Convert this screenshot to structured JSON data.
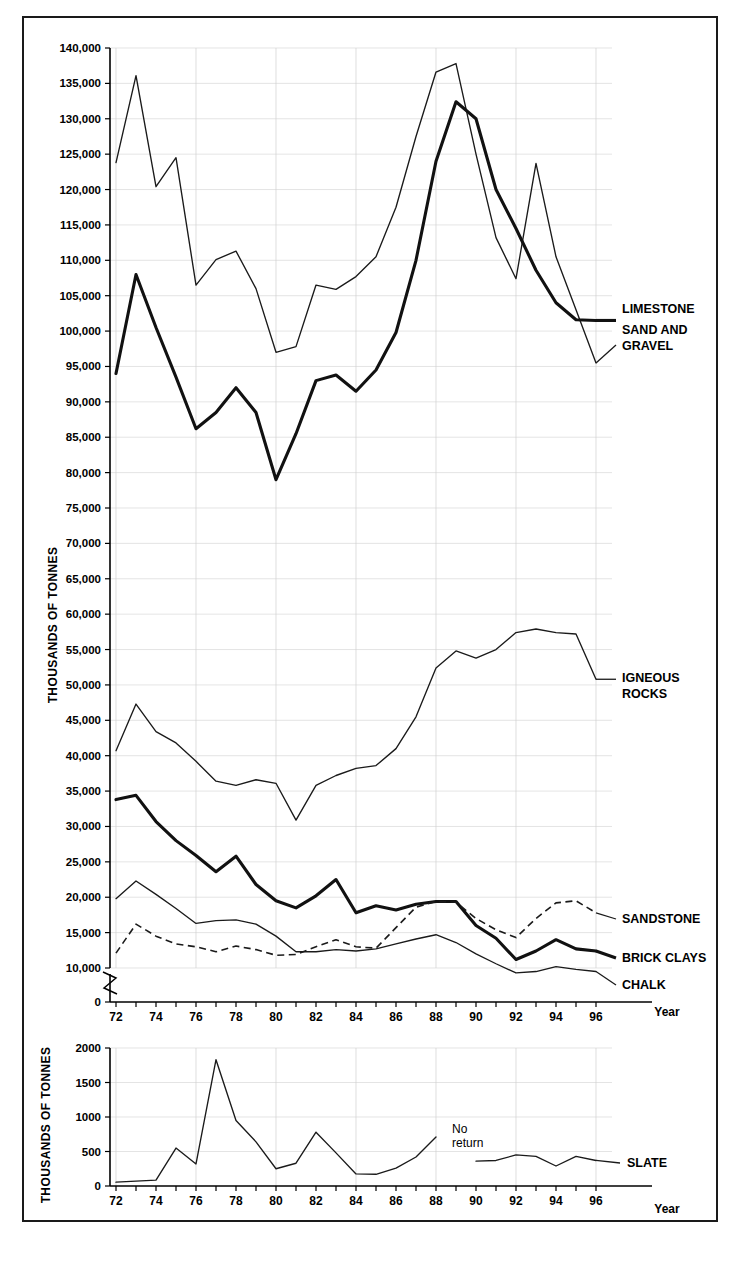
{
  "figure": {
    "frame_border_color": "#1a1a1a",
    "background": "#ffffff"
  },
  "upper_panel": {
    "ylabel": "THOUSANDS OF TONNES",
    "xlabel": "Year",
    "axis_break": true,
    "series_labels": {
      "limestone": "LIMESTONE",
      "sand_and_gravel": "SAND AND\nGRAVEL",
      "sand_and_gravel_line1": "SAND AND",
      "sand_and_gravel_line2": "GRAVEL",
      "igneous_line1": "IGNEOUS",
      "igneous_line2": "ROCKS",
      "sandstone": "SANDSTONE",
      "brick_clays": "BRICK CLAYS",
      "chalk": "CHALK"
    }
  },
  "lower_panel": {
    "ylabel": "THOUSANDS OF TONNES",
    "xlabel": "Year",
    "series_label": "SLATE",
    "annotation_line1": "No",
    "annotation_line2": "return"
  },
  "chart_data": [
    {
      "type": "line",
      "title": "",
      "panel": "upper",
      "xlabel": "Year",
      "ylabel": "THOUSANDS OF TONNES",
      "xlim": [
        1971.6,
        1996.8
      ],
      "ylim": [
        0,
        140000
      ],
      "yticks": [
        0,
        10000,
        15000,
        20000,
        25000,
        30000,
        35000,
        40000,
        45000,
        50000,
        55000,
        60000,
        65000,
        70000,
        75000,
        80000,
        85000,
        90000,
        95000,
        100000,
        105000,
        110000,
        115000,
        120000,
        125000,
        130000,
        135000,
        140000
      ],
      "ytick_labels": [
        "0",
        "10,000",
        "15,000",
        "20,000",
        "25,000",
        "30,000",
        "35,000",
        "40,000",
        "45,000",
        "50,000",
        "55,000",
        "60,000",
        "65,000",
        "70,000",
        "75,000",
        "80,000",
        "85,000",
        "90,000",
        "95,000",
        "100,000",
        "105,000",
        "110,000",
        "115,000",
        "120,000",
        "125,000",
        "130,000",
        "135,000",
        "140,000"
      ],
      "xticks": [
        1972,
        1974,
        1976,
        1978,
        1980,
        1982,
        1984,
        1986,
        1988,
        1990,
        1992,
        1994,
        1996
      ],
      "xtick_labels": [
        "72",
        "74",
        "76",
        "78",
        "80",
        "82",
        "84",
        "86",
        "88",
        "90",
        "92",
        "94",
        "96"
      ],
      "grid": true,
      "legend_position": "right-inline",
      "x": [
        1972,
        1973,
        1974,
        1975,
        1976,
        1977,
        1978,
        1979,
        1980,
        1981,
        1982,
        1983,
        1984,
        1985,
        1986,
        1987,
        1988,
        1989,
        1990,
        1991,
        1992,
        1993,
        1994,
        1995,
        1996
      ],
      "series": [
        {
          "name": "SAND AND GRAVEL",
          "style": "thin",
          "values": [
            123800,
            136100,
            120400,
            124500,
            106500,
            110100,
            111300,
            106000,
            97000,
            97800,
            106500,
            105900,
            107700,
            110500,
            117500,
            127500,
            136600,
            137800,
            125000,
            113200,
            107400,
            123700,
            110500,
            103000,
            95500
          ]
        },
        {
          "name": "LIMESTONE",
          "style": "bold",
          "values": [
            94000,
            108000,
            100500,
            93500,
            86200,
            88500,
            92000,
            88500,
            79000,
            85500,
            93000,
            93800,
            91500,
            94500,
            99800,
            110000,
            124000,
            132400,
            130000,
            120000,
            114500,
            108600,
            104000,
            101600,
            101500
          ]
        },
        {
          "name": "IGNEOUS ROCKS",
          "style": "thin",
          "values": [
            40700,
            47300,
            43400,
            41800,
            39200,
            36400,
            35800,
            36600,
            36100,
            30900,
            35800,
            37200,
            38200,
            38600,
            41000,
            45500,
            52400,
            54800,
            53800,
            55000,
            57400,
            57900,
            57400,
            57200,
            50800
          ]
        },
        {
          "name": "BRICK CLAYS",
          "style": "bold",
          "values": [
            33800,
            34400,
            30700,
            28000,
            25900,
            23600,
            25800,
            21800,
            19500,
            18500,
            20200,
            22500,
            17800,
            18800,
            18200,
            19000,
            19400,
            19400,
            16000,
            14200,
            11200,
            12400,
            14000,
            12700,
            12400
          ]
        },
        {
          "name": "CHALK",
          "style": "thin",
          "values": [
            19800,
            22300,
            20400,
            18400,
            16300,
            16700,
            16800,
            16200,
            14500,
            12300,
            12300,
            12600,
            12400,
            12700,
            13400,
            14100,
            14700,
            13600,
            12000,
            10600,
            9300,
            9500,
            10200,
            9800,
            9500
          ]
        },
        {
          "name": "SANDSTONE",
          "style": "dashed",
          "values": [
            12100,
            16200,
            14500,
            13400,
            13000,
            12300,
            13100,
            12600,
            11800,
            11900,
            13000,
            14000,
            13000,
            12800,
            15700,
            18600,
            19400,
            19300,
            17000,
            15400,
            14300,
            17000,
            19200,
            19500,
            17800
          ]
        }
      ]
    },
    {
      "type": "line",
      "title": "",
      "panel": "lower",
      "xlabel": "Year",
      "ylabel": "THOUSANDS OF TONNES",
      "xlim": [
        1971.6,
        1996.8
      ],
      "ylim": [
        0,
        2000
      ],
      "yticks": [
        0,
        500,
        1000,
        1500,
        2000
      ],
      "ytick_labels": [
        "0",
        "500",
        "1000",
        "1500",
        "2000"
      ],
      "xticks": [
        1972,
        1974,
        1976,
        1978,
        1980,
        1982,
        1984,
        1986,
        1988,
        1990,
        1992,
        1994,
        1996
      ],
      "xtick_labels": [
        "72",
        "74",
        "76",
        "78",
        "80",
        "82",
        "84",
        "86",
        "88",
        "90",
        "92",
        "94",
        "96"
      ],
      "grid": true,
      "annotations": [
        {
          "text": "No return",
          "x": 1989.4,
          "y": 640
        }
      ],
      "series": [
        {
          "name": "SLATE",
          "style": "thin",
          "gap_after_x": 1988,
          "gap_resume_x": 1990,
          "x": [
            1972,
            1973,
            1974,
            1975,
            1976,
            1977,
            1978,
            1979,
            1980,
            1981,
            1982,
            1983,
            1984,
            1985,
            1986,
            1987,
            1988,
            1990,
            1991,
            1992,
            1993,
            1994,
            1995,
            1996
          ],
          "values": [
            55,
            70,
            85,
            550,
            320,
            1830,
            950,
            640,
            250,
            330,
            780,
            480,
            175,
            170,
            260,
            420,
            710,
            360,
            370,
            450,
            430,
            290,
            430,
            370
          ]
        }
      ]
    }
  ]
}
